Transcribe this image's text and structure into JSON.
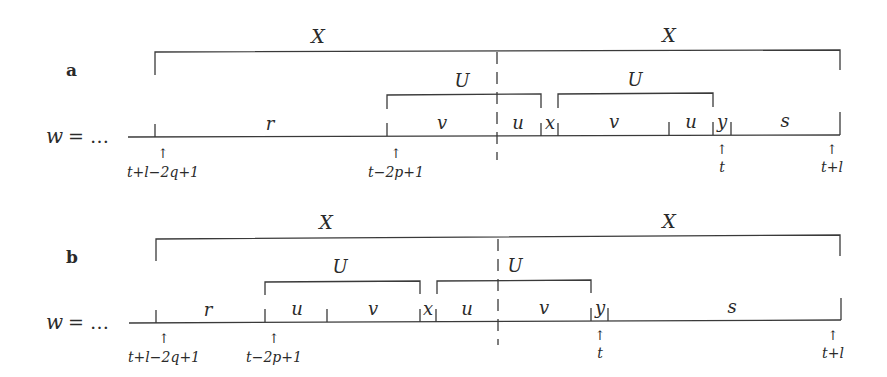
{
  "figure": {
    "panels": [
      {
        "label": "a",
        "word_prefix": "w = …",
        "outer_brackets": [
          {
            "label": "X",
            "from": "t+l−2q+1",
            "to": "center"
          },
          {
            "label": "X",
            "from": "center",
            "to": "t+l"
          }
        ],
        "inner_brackets": [
          {
            "label": "U",
            "covers": [
              "v",
              "u"
            ]
          },
          {
            "label": "U",
            "covers": [
              "v",
              "u"
            ]
          }
        ],
        "segments": [
          "r",
          "v",
          "u",
          "x",
          "v",
          "u",
          "y",
          "s"
        ],
        "positions": [
          "t+l−2q+1",
          "t−2p+1",
          "t",
          "t+l"
        ]
      },
      {
        "label": "b",
        "word_prefix": "w = …",
        "outer_brackets": [
          {
            "label": "X",
            "from": "t+l−2q+1",
            "to": "center"
          },
          {
            "label": "X",
            "from": "center",
            "to": "t+l"
          }
        ],
        "inner_brackets": [
          {
            "label": "U",
            "covers": [
              "u",
              "v"
            ]
          },
          {
            "label": "U",
            "covers": [
              "u",
              "v"
            ]
          }
        ],
        "segments": [
          "r",
          "u",
          "v",
          "x",
          "u",
          "v",
          "y",
          "s"
        ],
        "positions": [
          "t+l−2q+1",
          "t−2p+1",
          "t",
          "t+l"
        ]
      }
    ]
  },
  "a": {
    "label": "a",
    "w": "w",
    "eq": "= …",
    "X1": "X",
    "X2": "X",
    "U1": "U",
    "U2": "U",
    "seg": {
      "r": "r",
      "v1": "v",
      "u1": "u",
      "x": "x",
      "v2": "v",
      "u2": "u",
      "y": "y",
      "s": "s"
    },
    "pos": {
      "p1": "t+l−2q+1",
      "p2": "t−2p+1",
      "p3": "t",
      "p4": "t+l"
    },
    "arrow": "↑"
  },
  "b": {
    "label": "b",
    "w": "w",
    "eq": "= …",
    "X1": "X",
    "X2": "X",
    "U1": "U",
    "U2": "U",
    "seg": {
      "r": "r",
      "u1": "u",
      "v1": "v",
      "x": "x",
      "u2": "u",
      "v2": "v",
      "y": "y",
      "s": "s"
    },
    "pos": {
      "p1": "t+l−2q+1",
      "p2": "t−2p+1",
      "p3": "t",
      "p4": "t+l"
    },
    "arrow": "↑"
  }
}
